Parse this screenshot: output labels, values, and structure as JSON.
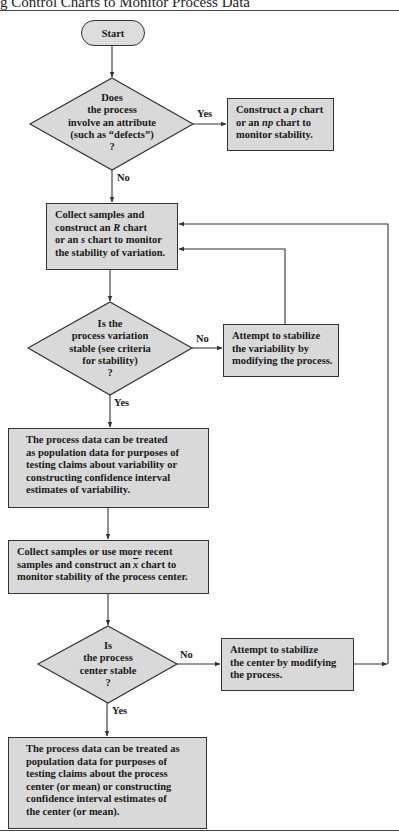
{
  "title": "g Control Charts to Monitor Process Data",
  "start": {
    "label": "Start"
  },
  "decisions": [
    {
      "id": "attribute",
      "lines": [
        "Does",
        "the process",
        "involve an attribute",
        "(such as “defects”)",
        "?"
      ],
      "yes": "Yes",
      "no": "No"
    },
    {
      "id": "variation-stable",
      "lines": [
        "Is the",
        "process variation",
        "stable (see criteria",
        "for stability)",
        "?"
      ],
      "yes": "Yes",
      "no": "No"
    },
    {
      "id": "center-stable",
      "lines": [
        "Is",
        "the process",
        "center stable",
        "?"
      ],
      "yes": "Yes",
      "no": "No"
    }
  ],
  "boxes": {
    "p_chart": {
      "pre1": "Construct a ",
      "em1": "p",
      "post1": " chart",
      "pre2": "or an ",
      "em2": "np",
      "post2": " chart to",
      "line3": "monitor stability."
    },
    "r_chart": {
      "line1": "Collect samples and",
      "pre2": "construct an ",
      "em2": "R",
      "post2": " chart",
      "pre3": "or an ",
      "em3": "s",
      "post3": " chart to monitor",
      "line4": "the stability of variation."
    },
    "stabilize_variability": {
      "lines": [
        "Attempt to stabilize",
        "the variability by",
        "modifying the process."
      ]
    },
    "population_variability": {
      "lines": [
        "The process data can be treated",
        "as population data for purposes of",
        "testing claims about variability or",
        "constructing confidence interval",
        "estimates of variability."
      ]
    },
    "xbar_chart": {
      "line1": "Collect samples or use more recent",
      "pre2": "samples and construct an ",
      "em2": "x",
      "post2": " chart to",
      "line3": "monitor stability of the process center."
    },
    "stabilize_center": {
      "lines": [
        "Attempt to stabilize",
        "the center by modifying",
        "the process."
      ]
    },
    "population_center": {
      "lines": [
        "The process data can be treated as",
        "population data for purposes of",
        "testing claims about the process",
        "center (or mean) or constructing",
        "confidence interval estimates of",
        "the center (or mean)."
      ]
    }
  },
  "colors": {
    "fill": "#d9d9d9",
    "stroke": "#333333",
    "background": "#ffffff"
  }
}
